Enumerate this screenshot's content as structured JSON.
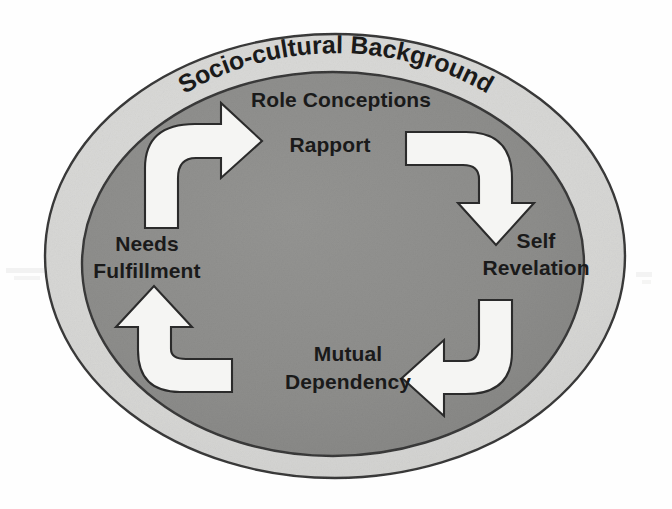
{
  "diagram": {
    "type": "cyclical-process",
    "outer_ring": {
      "label": "Socio-cultural Background",
      "fill_color": "#d6d6d4",
      "stroke_color": "#3a3a3a"
    },
    "inner_circle": {
      "fill_color": "#8d8d8b",
      "stroke_color": "#3a3a3a"
    },
    "background_color": "#fefefe",
    "text_color": "#1a1a1a",
    "arrow_fill_color": "#f5f5f3",
    "arrow_stroke_color": "#2b2b2b",
    "nodes": [
      {
        "id": "role-conceptions",
        "label": "Role Conceptions",
        "position": "top",
        "lines": [
          "Role Conceptions"
        ]
      },
      {
        "id": "rapport",
        "label": "Rapport",
        "position": "top-center",
        "lines": [
          "Rapport"
        ]
      },
      {
        "id": "self-revelation",
        "label": "Self Revelation",
        "position": "right",
        "lines": [
          "Self",
          "Revelation"
        ]
      },
      {
        "id": "mutual-dependency",
        "label": "Mutual Dependency",
        "position": "bottom",
        "lines": [
          "Mutual",
          "Dependency"
        ]
      },
      {
        "id": "needs-fulfillment",
        "label": "Needs Fulfillment",
        "position": "left",
        "lines": [
          "Needs",
          "Fulfillment"
        ]
      }
    ],
    "arrows": [
      {
        "id": "arrow-top-left",
        "direction": "up-right",
        "from": "needs-fulfillment",
        "to": "role-conceptions"
      },
      {
        "id": "arrow-top-right",
        "direction": "right-down",
        "from": "rapport",
        "to": "self-revelation"
      },
      {
        "id": "arrow-bottom-right",
        "direction": "down-left",
        "from": "self-revelation",
        "to": "mutual-dependency"
      },
      {
        "id": "arrow-bottom-left",
        "direction": "left-up",
        "from": "mutual-dependency",
        "to": "needs-fulfillment"
      }
    ]
  }
}
